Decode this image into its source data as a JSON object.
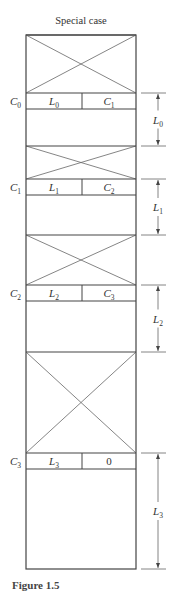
{
  "title": "Special case",
  "caption": "Figure 1.5",
  "colors": {
    "stroke": "#444444",
    "thin": "#666666",
    "background": "#ffffff"
  },
  "column": {
    "left": 26,
    "right": 136,
    "top": 35,
    "bottom": 569,
    "divider_x": 82
  },
  "blocks": [
    {
      "index": 0,
      "free_top": 35,
      "header_top": 93,
      "header_bottom": 109,
      "region_end": 146,
      "left_label": "C",
      "left_sub": "0",
      "cell_left": "L",
      "cell_left_sub": "0",
      "cell_right": "C",
      "cell_right_sub": "1",
      "dim_label": "L",
      "dim_sub": "0"
    },
    {
      "index": 1,
      "free_top": 146,
      "header_top": 179,
      "header_bottom": 195,
      "region_end": 235,
      "left_label": "C",
      "left_sub": "1",
      "cell_left": "L",
      "cell_left_sub": "1",
      "cell_right": "C",
      "cell_right_sub": "2",
      "dim_label": "L",
      "dim_sub": "1"
    },
    {
      "index": 2,
      "free_top": 235,
      "header_top": 285,
      "header_bottom": 301,
      "region_end": 352,
      "left_label": "C",
      "left_sub": "2",
      "cell_left": "L",
      "cell_left_sub": "2",
      "cell_right": "C",
      "cell_right_sub": "3",
      "dim_label": "L",
      "dim_sub": "2"
    },
    {
      "index": 3,
      "free_top": 352,
      "header_top": 453,
      "header_bottom": 469,
      "region_end": 569,
      "left_label": "C",
      "left_sub": "3",
      "cell_left": "L",
      "cell_left_sub": "3",
      "cell_right": "0",
      "cell_right_sub": "",
      "dim_label": "L",
      "dim_sub": "3"
    }
  ],
  "dimension": {
    "line_x": 158,
    "tick_x1": 141,
    "tick_x2": 166
  }
}
